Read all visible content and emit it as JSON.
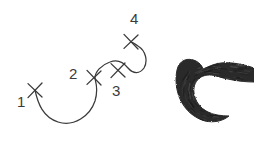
{
  "figure": {
    "background_color": "#ffffff",
    "width": 254,
    "height": 148
  },
  "colors": {
    "outline_stroke": "#3a3a3a",
    "label_text": "#3b3b3b",
    "brush_fill": "#2b2b2b",
    "brush_texture": "#1c1c1c",
    "background": "#ffffff"
  },
  "control_points": [
    {
      "label": "1",
      "x": 35,
      "y": 90,
      "label_x": 17,
      "label_y": 107
    },
    {
      "label": "2",
      "x": 94,
      "y": 78,
      "label_x": 69,
      "label_y": 79
    },
    {
      "label": "3",
      "x": 118,
      "y": 70,
      "label_x": 112,
      "label_y": 96
    },
    {
      "label": "4",
      "x": 131,
      "y": 42,
      "label_x": 130,
      "label_y": 24
    }
  ],
  "skeleton_path": {
    "name": "guide-curve",
    "d": "M 35 90 C 38 104 43 117 58 122 C 74 127 90 116 95 101 C 99 88 95 81 95 78 C 95 72 101 65 110 62 C 118 59 124 63 128 68 C 133 74 140 74 144 68 C 148 61 146 51 138 46 C 134 43 132 42 131 42",
    "stroke_width": 1.25
  },
  "crosses": {
    "arm_length": 7,
    "stroke_width": 1.3
  },
  "brush_stroke": {
    "name": "rendered-brush-shape",
    "description": "thick hooked C-shaped charcoal brush stroke with tapering tail to the right",
    "outline_d": "M 254 68 C 243 64 231 62 221 63 C 213 64 208 67 203 69 C 202 66 200 63 196 61 C 188 57 179 60 177 70 C 175 79 176 90 180 99 C 185 110 194 118 205 121 C 214 123 223 121 229 116 C 222 116 214 115 208 112 C 200 108 195 101 194 93 C 193 86 196 80 201 77 C 205 75 210 74 216 76 C 226 79 240 82 254 82 Z",
    "center_d": "M 254 75 C 240 73 226 70 216 69 C 205 68 196 72 191 79 C 186 86 186 96 191 104 C 197 113 208 118 219 118",
    "center_width": 20
  }
}
